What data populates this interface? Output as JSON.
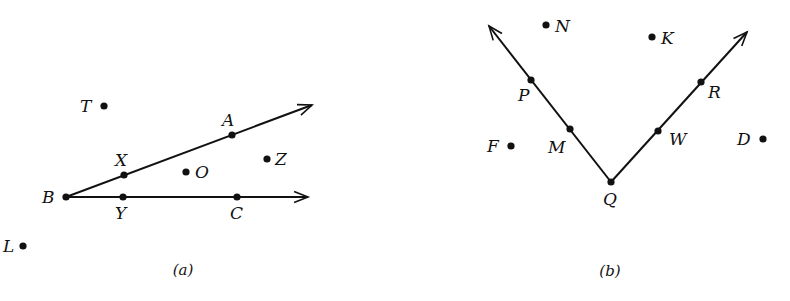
{
  "colors": {
    "ink": "#111111",
    "background": "#ffffff"
  },
  "figures": [
    {
      "id": "a",
      "caption": "(a)",
      "vertex": {
        "label": "B",
        "x": 66,
        "y": 197
      },
      "rays": [
        {
          "name": "ray-BA",
          "from": [
            66,
            197
          ],
          "to": [
            312,
            105
          ],
          "points": [
            "X",
            "A"
          ]
        },
        {
          "name": "ray-BC",
          "from": [
            66,
            197
          ],
          "to": [
            308,
            197
          ],
          "points": [
            "Y",
            "C"
          ]
        }
      ],
      "points": [
        {
          "label": "B",
          "x": 66,
          "y": 197,
          "lx": 42,
          "ly": 203,
          "on_ray": true
        },
        {
          "label": "X",
          "x": 124,
          "y": 175,
          "lx": 115,
          "ly": 166,
          "on_ray": true
        },
        {
          "label": "A",
          "x": 232,
          "y": 135,
          "lx": 222,
          "ly": 126,
          "on_ray": true
        },
        {
          "label": "Y",
          "x": 123,
          "y": 197,
          "lx": 115,
          "ly": 219,
          "on_ray": true
        },
        {
          "label": "C",
          "x": 237,
          "y": 197,
          "lx": 230,
          "ly": 219,
          "on_ray": true
        },
        {
          "label": "T",
          "x": 104,
          "y": 106,
          "lx": 80,
          "ly": 112,
          "on_ray": false
        },
        {
          "label": "O",
          "x": 186,
          "y": 172,
          "lx": 195,
          "ly": 178,
          "on_ray": false
        },
        {
          "label": "Z",
          "x": 267,
          "y": 159,
          "lx": 275,
          "ly": 165,
          "on_ray": false
        },
        {
          "label": "L",
          "x": 23,
          "y": 246,
          "lx": 3,
          "ly": 252,
          "on_ray": false
        }
      ],
      "caption_pos": {
        "x": 183,
        "y": 275
      }
    },
    {
      "id": "b",
      "caption": "(b)",
      "vertex": {
        "label": "Q",
        "x": 611,
        "y": 182
      },
      "rays": [
        {
          "name": "ray-QP",
          "from": [
            611,
            182
          ],
          "to": [
            489,
            26
          ],
          "points": [
            "M",
            "P"
          ]
        },
        {
          "name": "ray-QR",
          "from": [
            611,
            182
          ],
          "to": [
            747,
            32
          ],
          "points": [
            "W",
            "R"
          ]
        }
      ],
      "points": [
        {
          "label": "Q",
          "x": 611,
          "y": 182,
          "lx": 603,
          "ly": 205,
          "on_ray": true
        },
        {
          "label": "M",
          "x": 570,
          "y": 129,
          "lx": 548,
          "ly": 153,
          "on_ray": true
        },
        {
          "label": "P",
          "x": 531,
          "y": 80,
          "lx": 518,
          "ly": 101,
          "on_ray": true
        },
        {
          "label": "W",
          "x": 658,
          "y": 131,
          "lx": 669,
          "ly": 145,
          "on_ray": true
        },
        {
          "label": "R",
          "x": 701,
          "y": 82,
          "lx": 708,
          "ly": 98,
          "on_ray": true
        },
        {
          "label": "N",
          "x": 546,
          "y": 25,
          "lx": 555,
          "ly": 32,
          "on_ray": false
        },
        {
          "label": "K",
          "x": 652,
          "y": 37,
          "lx": 661,
          "ly": 44,
          "on_ray": false
        },
        {
          "label": "F",
          "x": 511,
          "y": 146,
          "lx": 487,
          "ly": 152,
          "on_ray": false
        },
        {
          "label": "D",
          "x": 763,
          "y": 139,
          "lx": 737,
          "ly": 145,
          "on_ray": false
        }
      ],
      "caption_pos": {
        "x": 610,
        "y": 276
      }
    }
  ]
}
